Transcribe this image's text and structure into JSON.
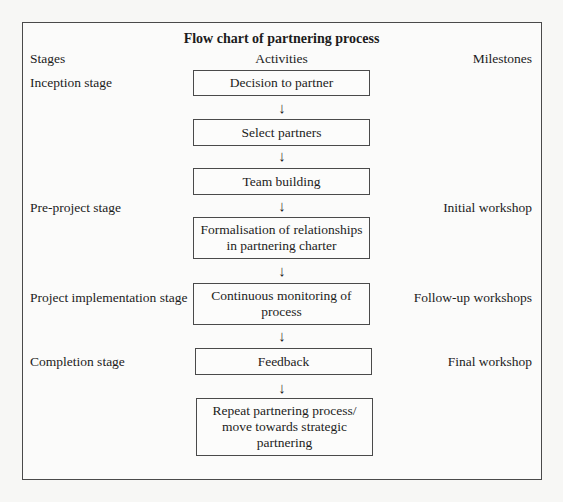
{
  "title": "Flow chart of partnering process",
  "headers": {
    "stages": "Stages",
    "activities": "Activities",
    "milestones": "Milestones"
  },
  "stages": [
    "Inception stage",
    "Pre-project stage",
    "Project implementation stage",
    "Completion stage"
  ],
  "activities": [
    {
      "lines": [
        "Decision to partner"
      ]
    },
    {
      "lines": [
        "Select partners"
      ]
    },
    {
      "lines": [
        "Team building"
      ]
    },
    {
      "lines": [
        "Formalisation of relationships",
        "in partnering charter"
      ]
    },
    {
      "lines": [
        "Continuous monitoring of",
        "process"
      ]
    },
    {
      "lines": [
        "Feedback"
      ]
    },
    {
      "lines": [
        "Repeat partnering process/",
        "move towards strategic",
        "partnering"
      ]
    }
  ],
  "milestones": [
    "Initial workshop",
    "Follow-up workshops",
    "Final workshop"
  ],
  "arrow_glyph": "↓",
  "colors": {
    "border": "#4a4a4a",
    "text": "#1c1c1c",
    "background": "#f7f7f5"
  }
}
